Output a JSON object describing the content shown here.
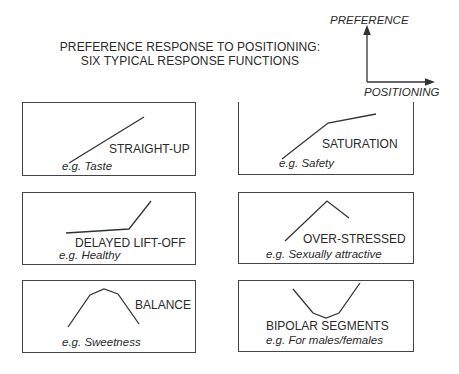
{
  "title": {
    "line1": "PREFERENCE RESPONSE TO POSITIONING:",
    "line2": "SIX TYPICAL RESPONSE FUNCTIONS"
  },
  "axes": {
    "y_label": "PREFERENCE",
    "x_label": "POSITIONING"
  },
  "panels": [
    {
      "name": "STRAIGHT-UP",
      "example": "e.g. Taste",
      "shape": "straight-up"
    },
    {
      "name": "SATURATION",
      "example": "e.g. Safety",
      "shape": "saturation"
    },
    {
      "name": "DELAYED LIFT-OFF",
      "example": "e.g. Healthy",
      "shape": "delayed-lift-off"
    },
    {
      "name": "OVER-STRESSED",
      "example": "e.g. Sexually attractive",
      "shape": "over-stressed"
    },
    {
      "name": "BALANCE",
      "example": "e.g. Sweetness",
      "shape": "balance"
    },
    {
      "name": "BIPOLAR SEGMENTS",
      "example": "e.g. For males/females",
      "shape": "bipolar-segments"
    }
  ],
  "colors": {
    "line": "#333333",
    "border": "#444444",
    "background": "#ffffff"
  }
}
